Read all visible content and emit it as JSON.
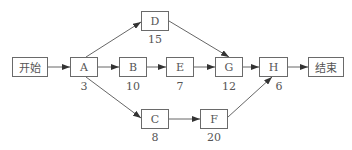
{
  "diagram": {
    "type": "activity-network",
    "nodes": [
      {
        "id": "start",
        "label": "开始",
        "duration": null
      },
      {
        "id": "A",
        "label": "A",
        "duration": "3"
      },
      {
        "id": "D",
        "label": "D",
        "duration": "15"
      },
      {
        "id": "B",
        "label": "B",
        "duration": "10"
      },
      {
        "id": "E",
        "label": "E",
        "duration": "7"
      },
      {
        "id": "G",
        "label": "G",
        "duration": "12"
      },
      {
        "id": "H",
        "label": "H",
        "duration": "6"
      },
      {
        "id": "end",
        "label": "结束",
        "duration": null
      },
      {
        "id": "C",
        "label": "C",
        "duration": "8"
      },
      {
        "id": "F",
        "label": "F",
        "duration": "20"
      }
    ],
    "edges": [
      [
        "开始",
        "A"
      ],
      [
        "A",
        "D"
      ],
      [
        "A",
        "B"
      ],
      [
        "A",
        "C"
      ],
      [
        "B",
        "E"
      ],
      [
        "E",
        "G"
      ],
      [
        "D",
        "G"
      ],
      [
        "G",
        "H"
      ],
      [
        "C",
        "F"
      ],
      [
        "F",
        "H"
      ],
      [
        "H",
        "结束"
      ]
    ]
  },
  "nodes": {
    "start": {
      "label": "开始"
    },
    "A": {
      "label": "A",
      "duration": "3"
    },
    "D": {
      "label": "D",
      "duration": "15"
    },
    "B": {
      "label": "B",
      "duration": "10"
    },
    "E": {
      "label": "E",
      "duration": "7"
    },
    "G": {
      "label": "G",
      "duration": "12"
    },
    "H": {
      "label": "H",
      "duration": "6"
    },
    "end": {
      "label": "结束"
    },
    "C": {
      "label": "C",
      "duration": "8"
    },
    "F": {
      "label": "F",
      "duration": "20"
    }
  }
}
